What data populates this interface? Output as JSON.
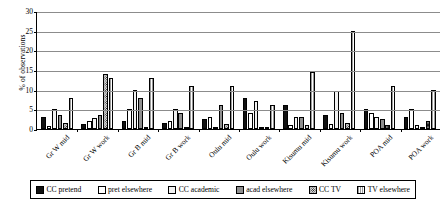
{
  "chart_data": {
    "type": "bar",
    "title": "",
    "xlabel": "",
    "ylabel": "% of observations",
    "ylim": [
      0,
      30
    ],
    "yticks": [
      0,
      5,
      10,
      15,
      20,
      25,
      30
    ],
    "grid": true,
    "legend_position": "bottom",
    "categories": [
      "Gr W mid",
      "Gr W work",
      "Gr B mid",
      "Gr B work",
      "Oulu mid",
      "Oulu work",
      "Kisumu mid",
      "Kisumu work",
      "POA mid",
      "POA work"
    ],
    "series": [
      {
        "name": "CC pretend",
        "fill": "solid-black",
        "values": [
          3.0,
          1.3,
          2.0,
          1.5,
          2.6,
          8.0,
          6.0,
          3.6,
          5.0,
          3.0
        ]
      },
      {
        "name": "pret elsewhere",
        "fill": "white",
        "values": [
          0.8,
          2.0,
          5.0,
          2.1,
          3.1,
          4.0,
          1.0,
          1.3,
          4.0,
          5.0
        ]
      },
      {
        "name": "CC academic",
        "fill": "light-gray",
        "values": [
          5.0,
          2.8,
          10.0,
          5.2,
          0.6,
          7.0,
          3.0,
          9.6,
          3.0,
          1.0
        ]
      },
      {
        "name": "acad elsewhere",
        "fill": "mid-gray",
        "values": [
          3.5,
          3.6,
          8.0,
          4.0,
          6.2,
          0.0,
          3.0,
          4.0,
          2.6,
          0.0
        ]
      },
      {
        "name": "CC TV",
        "fill": "dotted",
        "values": [
          1.5,
          14.0,
          0.0,
          0.0,
          1.4,
          0.0,
          1.0,
          1.5,
          1.0,
          2.0
        ]
      },
      {
        "name": "TV elsewhere",
        "fill": "vertical-lines",
        "values": [
          8.0,
          13.0,
          13.0,
          11.0,
          11.0,
          6.0,
          14.5,
          25.0,
          11.0,
          10.0
        ]
      }
    ]
  }
}
